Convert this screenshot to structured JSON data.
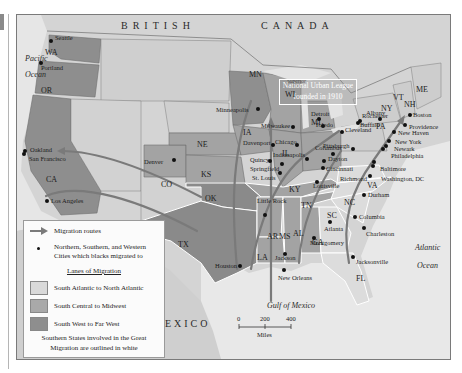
{
  "colors": {
    "frame_bg": "#dcdcdc",
    "canada": "#d4d4d4",
    "ocean": "#e8e8e8",
    "atlantic_lane": "#d9d9d9",
    "central_lane": "#a9a9a9",
    "west_lane": "#8e8e8e",
    "route": "#7a7a7a"
  },
  "regions": {
    "country_canada": "BRITISH     CANADA",
    "country_canada_a": "BRITISH",
    "country_canada_b": "CANADA",
    "country_mexico": "MEXICO",
    "pacific": "Pacific",
    "pacific_2": "Ocean",
    "atlantic": "Atlantic",
    "atlantic_2": "Ocean",
    "gulf": "Gulf of Mexico",
    "superior": "Superior"
  },
  "callout": {
    "line1": "National Urban League",
    "line2": "founded in 1910"
  },
  "states": [
    {
      "abbr": "WA",
      "x": 44,
      "y": 48
    },
    {
      "abbr": "OR",
      "x": 40,
      "y": 86
    },
    {
      "abbr": "CA",
      "x": 45,
      "y": 175
    },
    {
      "abbr": "CO",
      "x": 160,
      "y": 180
    },
    {
      "abbr": "NE",
      "x": 196,
      "y": 140
    },
    {
      "abbr": "KS",
      "x": 200,
      "y": 170
    },
    {
      "abbr": "OK",
      "x": 204,
      "y": 194
    },
    {
      "abbr": "TX",
      "x": 177,
      "y": 240
    },
    {
      "abbr": "MN",
      "x": 248,
      "y": 70
    },
    {
      "abbr": "WI",
      "x": 284,
      "y": 90
    },
    {
      "abbr": "IA",
      "x": 242,
      "y": 128
    },
    {
      "abbr": "IL",
      "x": 281,
      "y": 149
    },
    {
      "abbr": "MI",
      "x": 310,
      "y": 118
    },
    {
      "abbr": "KY",
      "x": 288,
      "y": 185
    },
    {
      "abbr": "TN",
      "x": 300,
      "y": 201
    },
    {
      "abbr": "AR",
      "x": 266,
      "y": 232
    },
    {
      "abbr": "LA",
      "x": 256,
      "y": 253
    },
    {
      "abbr": "MS",
      "x": 278,
      "y": 232
    },
    {
      "abbr": "AL",
      "x": 292,
      "y": 229
    },
    {
      "abbr": "GA",
      "x": 311,
      "y": 238
    },
    {
      "abbr": "SC",
      "x": 326,
      "y": 211
    },
    {
      "abbr": "NC",
      "x": 343,
      "y": 198
    },
    {
      "abbr": "VA",
      "x": 366,
      "y": 181
    },
    {
      "abbr": "PA",
      "x": 375,
      "y": 122
    },
    {
      "abbr": "NY",
      "x": 380,
      "y": 104
    },
    {
      "abbr": "VT",
      "x": 392,
      "y": 93
    },
    {
      "abbr": "NH",
      "x": 403,
      "y": 100
    },
    {
      "abbr": "ME",
      "x": 415,
      "y": 85
    },
    {
      "abbr": "FL",
      "x": 355,
      "y": 274
    }
  ],
  "cities": [
    {
      "name": "Seattle",
      "x": 50,
      "y": 40,
      "dx": 4,
      "dy": -6
    },
    {
      "name": "Portland",
      "x": 40,
      "y": 62,
      "dx": 0,
      "dy": 2
    },
    {
      "name": "Oakland",
      "x": 24,
      "y": 150,
      "dx": 5,
      "dy": -4
    },
    {
      "name": "San Francisco",
      "x": 23,
      "y": 153,
      "dx": 5,
      "dy": 2
    },
    {
      "name": "Los Angeles",
      "x": 46,
      "y": 200,
      "dx": 4,
      "dy": -3
    },
    {
      "name": "Denver",
      "x": 173,
      "y": 159,
      "dx": -30,
      "dy": -1
    },
    {
      "name": "Minneapolis",
      "x": 257,
      "y": 108,
      "dx": -42,
      "dy": -2
    },
    {
      "name": "Milwaukee",
      "x": 292,
      "y": 126,
      "dx": -32,
      "dy": -4
    },
    {
      "name": "Davenport",
      "x": 272,
      "y": 144,
      "dx": -30,
      "dy": -5
    },
    {
      "name": "Chicago",
      "x": 296,
      "y": 144,
      "dx": -22,
      "dy": -6
    },
    {
      "name": "Quincy",
      "x": 269,
      "y": 160,
      "dx": -20,
      "dy": -4
    },
    {
      "name": "Springfield",
      "x": 281,
      "y": 163,
      "dx": -32,
      "dy": 2
    },
    {
      "name": "St. Louis",
      "x": 279,
      "y": 172,
      "dx": -28,
      "dy": 2
    },
    {
      "name": "Indianapolis",
      "x": 306,
      "y": 158,
      "dx": -34,
      "dy": -7
    },
    {
      "name": "Detroit",
      "x": 318,
      "y": 118,
      "dx": -8,
      "dy": -8
    },
    {
      "name": "Toledo",
      "x": 322,
      "y": 125,
      "dx": -8,
      "dy": -4
    },
    {
      "name": "Columbus",
      "x": 332,
      "y": 153,
      "dx": -18,
      "dy": -9
    },
    {
      "name": "Dayton",
      "x": 323,
      "y": 160,
      "dx": 4,
      "dy": -5
    },
    {
      "name": "Cincinnati",
      "x": 322,
      "y": 167,
      "dx": 3,
      "dy": -2
    },
    {
      "name": "Louisville",
      "x": 316,
      "y": 181,
      "dx": -4,
      "dy": 1
    },
    {
      "name": "Cleveland",
      "x": 341,
      "y": 131,
      "dx": 3,
      "dy": -5
    },
    {
      "name": "Pittsburgh",
      "x": 352,
      "y": 148,
      "dx": -30,
      "dy": -6
    },
    {
      "name": "Buffalo",
      "x": 357,
      "y": 122,
      "dx": 2,
      "dy": -1
    },
    {
      "name": "Rochester",
      "x": 359,
      "y": 120,
      "dx": 2,
      "dy": -8
    },
    {
      "name": "Albany",
      "x": 379,
      "y": 118,
      "dx": -14,
      "dy": -9
    },
    {
      "name": "Boston",
      "x": 409,
      "y": 114,
      "dx": 3,
      "dy": -3
    },
    {
      "name": "Providence",
      "x": 404,
      "y": 124,
      "dx": 4,
      "dy": -1
    },
    {
      "name": "New Haven",
      "x": 393,
      "y": 131,
      "dx": 4,
      "dy": -2
    },
    {
      "name": "New York",
      "x": 388,
      "y": 140,
      "dx": 6,
      "dy": -2
    },
    {
      "name": "Newark",
      "x": 385,
      "y": 145,
      "dx": 8,
      "dy": 0
    },
    {
      "name": "Philadelphia",
      "x": 382,
      "y": 148,
      "dx": 8,
      "dy": 4
    },
    {
      "name": "Baltimore",
      "x": 373,
      "y": 161,
      "dx": 6,
      "dy": 4
    },
    {
      "name": "Washington, DC",
      "x": 372,
      "y": 165,
      "dx": 8,
      "dy": 10
    },
    {
      "name": "Richmond",
      "x": 369,
      "y": 175,
      "dx": -30,
      "dy": 0
    },
    {
      "name": "Durham",
      "x": 363,
      "y": 194,
      "dx": 4,
      "dy": -3
    },
    {
      "name": "Columbia",
      "x": 354,
      "y": 216,
      "dx": 4,
      "dy": -3
    },
    {
      "name": "Charleston",
      "x": 363,
      "y": 227,
      "dx": 2,
      "dy": 3
    },
    {
      "name": "Atlanta",
      "x": 329,
      "y": 221,
      "dx": -6,
      "dy": 4
    },
    {
      "name": "Montgomery",
      "x": 313,
      "y": 237,
      "dx": -4,
      "dy": 2
    },
    {
      "name": "Jacksonville",
      "x": 352,
      "y": 256,
      "dx": 3,
      "dy": 2
    },
    {
      "name": "Jackson",
      "x": 284,
      "y": 253,
      "dx": -10,
      "dy": 1
    },
    {
      "name": "New Orleans",
      "x": 283,
      "y": 269,
      "dx": -6,
      "dy": 5
    },
    {
      "name": "Little Rock",
      "x": 264,
      "y": 214,
      "dx": -8,
      "dy": -17
    },
    {
      "name": "Houston",
      "x": 239,
      "y": 265,
      "dx": -25,
      "dy": -3
    }
  ],
  "legend": {
    "routes_label": "Migration routes",
    "cities_label_1": "Northern, Southern, and Western",
    "cities_label_2": "Cities which blacks migrated to",
    "lanes_heading": "Lanes of Migration",
    "lane_1": "South Atlantic to North Atlantic",
    "lane_2": "South Central to Midwest",
    "lane_3": "South West to Far West",
    "note_1": "Southern States involved in the Great",
    "note_2": "Migration are outlined in white"
  },
  "scale": {
    "tick_0": "0",
    "tick_200": "200",
    "tick_400": "400",
    "unit": "Miles"
  }
}
